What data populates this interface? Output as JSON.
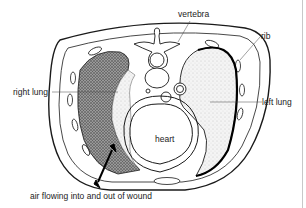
{
  "diagram": {
    "labels": {
      "vertebra": "vertebra",
      "rib": "rib",
      "right_lung": "right lung",
      "left_lung": "left lung",
      "heart": "heart",
      "wound": "air flowing into and out of wound"
    },
    "colors": {
      "ink": "#1a1a1a",
      "background": "#ffffff",
      "stipple_dark": "#555555",
      "stipple_light": "#d6d6d6",
      "edge_line": "#c8c8c8"
    }
  }
}
